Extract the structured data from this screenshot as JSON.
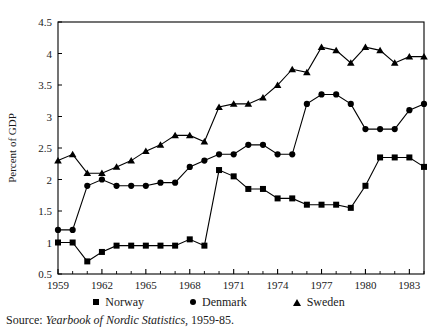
{
  "figure": {
    "ylabel": "Percent of GDP",
    "source_prefix": "Source:",
    "source_title": "Yearbook of Nordic Statistics,",
    "source_years": "1959-85."
  },
  "legend": {
    "items": [
      {
        "label": "Norway",
        "marker": "square-marker-icon",
        "color": "#000000"
      },
      {
        "label": "Denmark",
        "marker": "circle-marker-icon",
        "color": "#000000"
      },
      {
        "label": "Sweden",
        "marker": "triangle-marker-icon",
        "color": "#000000"
      }
    ]
  },
  "chart_data": {
    "type": "line",
    "title": "",
    "xlabel": "",
    "ylabel": "Percent of GDP",
    "xlim": [
      1959,
      1984
    ],
    "ylim": [
      0.5,
      4.5
    ],
    "ytick_labels": [
      "0.5",
      "1",
      "1.5",
      "2",
      "2.5",
      "3",
      "3.5",
      "4",
      "4.5"
    ],
    "yticks": [
      0.5,
      1,
      1.5,
      2,
      2.5,
      3,
      3.5,
      4,
      4.5
    ],
    "xtick_labels": [
      "1959",
      "1962",
      "1965",
      "1968",
      "1971",
      "1974",
      "1977",
      "1980",
      "1983"
    ],
    "xticks": [
      1959,
      1962,
      1965,
      1968,
      1971,
      1974,
      1977,
      1980,
      1983
    ],
    "xticks_minor": [
      1960,
      1961,
      1963,
      1964,
      1966,
      1967,
      1969,
      1970,
      1972,
      1973,
      1975,
      1976,
      1978,
      1979,
      1981,
      1982,
      1984
    ],
    "grid": false,
    "legend_position": "below",
    "x": [
      1959,
      1960,
      1961,
      1962,
      1963,
      1964,
      1965,
      1966,
      1967,
      1968,
      1969,
      1970,
      1971,
      1972,
      1973,
      1974,
      1975,
      1976,
      1977,
      1978,
      1979,
      1980,
      1981,
      1982,
      1983,
      1984
    ],
    "series": [
      {
        "name": "Norway",
        "marker": "square",
        "color": "#000000",
        "values": [
          1.0,
          1.0,
          0.7,
          0.85,
          0.95,
          0.95,
          0.95,
          0.95,
          0.95,
          1.05,
          0.95,
          2.15,
          2.05,
          1.85,
          1.85,
          1.7,
          1.7,
          1.6,
          1.6,
          1.6,
          1.55,
          1.9,
          2.35,
          2.35,
          2.35,
          2.2
        ]
      },
      {
        "name": "Denmark",
        "marker": "circle",
        "color": "#000000",
        "values": [
          1.2,
          1.2,
          1.9,
          2.0,
          1.9,
          1.9,
          1.9,
          1.95,
          1.95,
          2.2,
          2.3,
          2.4,
          2.4,
          2.55,
          2.55,
          2.4,
          2.4,
          3.2,
          3.35,
          3.35,
          3.2,
          2.8,
          2.8,
          2.8,
          3.1,
          3.2
        ]
      },
      {
        "name": "Sweden",
        "marker": "triangle",
        "color": "#000000",
        "values": [
          2.3,
          2.4,
          2.1,
          2.1,
          2.2,
          2.3,
          2.45,
          2.55,
          2.7,
          2.7,
          2.6,
          3.15,
          3.2,
          3.2,
          3.3,
          3.5,
          3.75,
          3.7,
          4.1,
          4.05,
          3.85,
          4.1,
          4.05,
          3.85,
          3.95,
          3.95
        ]
      }
    ]
  }
}
